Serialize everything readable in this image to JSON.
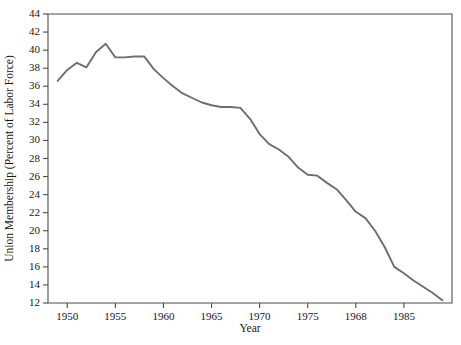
{
  "chart_data": {
    "type": "line",
    "title": "",
    "xlabel": "Year",
    "ylabel": "Union Membership (Percent of Labor Force)",
    "xlim": [
      1948,
      1990
    ],
    "ylim": [
      12,
      44
    ],
    "grid": false,
    "legend": null,
    "y_ticks": [
      12,
      14,
      16,
      18,
      20,
      22,
      24,
      26,
      28,
      30,
      32,
      34,
      36,
      38,
      40,
      42,
      44
    ],
    "x_ticks": [
      1950,
      1955,
      1960,
      1965,
      1970,
      1975,
      1980,
      1985
    ],
    "x_tick_labels": [
      "1950",
      "1955",
      "1960",
      "1965",
      "1970",
      "1975",
      "1968",
      "1985"
    ],
    "series": [
      {
        "name": "Union Membership",
        "color": "#6e6e6e",
        "x": [
          1949,
          1950,
          1951,
          1952,
          1953,
          1954,
          1955,
          1956,
          1957,
          1958,
          1959,
          1960,
          1961,
          1962,
          1963,
          1964,
          1965,
          1966,
          1967,
          1968,
          1969,
          1970,
          1971,
          1972,
          1973,
          1974,
          1975,
          1976,
          1977,
          1978,
          1979,
          1980,
          1981,
          1982,
          1983,
          1984,
          1985,
          1986,
          1987,
          1988,
          1989
        ],
        "values": [
          36.6,
          37.8,
          38.6,
          38.1,
          39.8,
          40.7,
          39.2,
          39.2,
          39.3,
          39.3,
          37.9,
          36.9,
          36.0,
          35.2,
          34.7,
          34.2,
          33.9,
          33.7,
          33.7,
          33.6,
          32.4,
          30.7,
          29.6,
          29.0,
          28.2,
          27.0,
          26.2,
          26.1,
          25.3,
          24.6,
          23.4,
          22.1,
          21.4,
          20.0,
          18.2,
          16.0,
          15.3,
          14.5,
          13.8,
          13.1,
          12.3
        ]
      }
    ]
  },
  "figure": {
    "plot_area": {
      "left": 48,
      "top": 14,
      "right": 452,
      "bottom": 303
    },
    "background_color": "#ffffff",
    "axis_color": "#4d4d4d"
  }
}
